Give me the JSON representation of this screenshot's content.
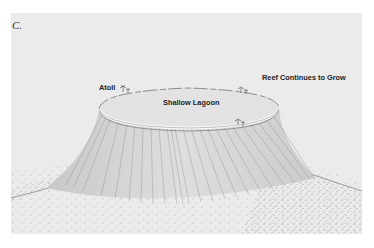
{
  "figure": {
    "panel_label": "C.",
    "labels": {
      "atoll": "Atoll",
      "lagoon": "Shallow Lagoon",
      "reef": "Reef Continues to Grow"
    },
    "colors": {
      "background": "#ffffff",
      "panel": "#ebebeb",
      "ink": "#555555",
      "rim": "#f8f8f8"
    }
  }
}
